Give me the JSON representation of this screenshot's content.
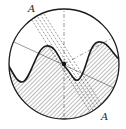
{
  "diagram": {
    "labels": {
      "top": "A",
      "bottom": "A"
    },
    "colors": {
      "stroke": "#1a1a1a",
      "hatch": "#555555",
      "background": "#ffffff"
    }
  }
}
